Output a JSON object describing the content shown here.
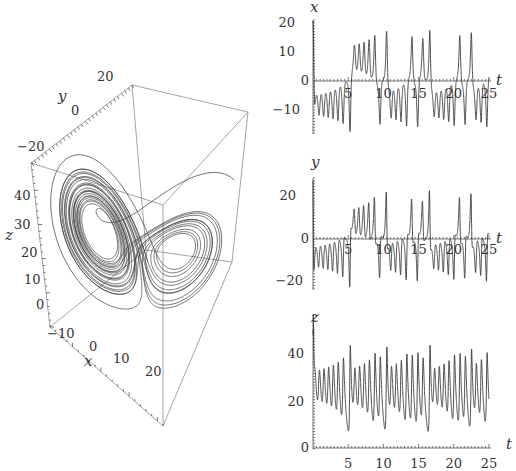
{
  "chart_data": [
    {
      "type": "line",
      "subtype": "3d-parametric",
      "title": "Lorenz attractor trajectory",
      "axes": {
        "x": {
          "label": "x",
          "ticks": [
            "−10",
            "0",
            "10",
            "20"
          ],
          "range": [
            -18,
            22
          ]
        },
        "y": {
          "label": "y",
          "ticks": [
            "−20",
            "0",
            "20"
          ],
          "range": [
            -28,
            28
          ]
        },
        "z": {
          "label": "z",
          "ticks": [
            "0",
            "10",
            "20",
            "30",
            "40"
          ],
          "range": [
            0,
            48
          ]
        }
      },
      "grid": false,
      "box": true,
      "system": {
        "sigma": 10,
        "rho": 28,
        "beta": 2.667,
        "t_range": [
          0,
          25
        ]
      }
    },
    {
      "type": "line",
      "title": "",
      "xlabel": "t",
      "ylabel": "x",
      "xticks": [
        "5",
        "10",
        "15",
        "20",
        "25"
      ],
      "yticks": [
        "20",
        "10",
        "0",
        "−10"
      ],
      "xlim": [
        0,
        25
      ],
      "ylim": [
        -18,
        20
      ],
      "features": {
        "initial_value": 20,
        "early_oscillation_center": -8,
        "max_peak": 18,
        "min_trough": -17,
        "first_crossing_t": 14.3
      }
    },
    {
      "type": "line",
      "title": "",
      "xlabel": "t",
      "ylabel": "y",
      "xticks": [
        "5",
        "10",
        "15",
        "20",
        "25"
      ],
      "yticks": [
        "20",
        "0",
        "−20"
      ],
      "xlim": [
        0,
        25
      ],
      "ylim": [
        -23,
        28
      ],
      "features": {
        "initial_value": 28,
        "early_oscillation_center": -8,
        "max_peak": 24,
        "min_trough": -22,
        "first_crossing_t": 14.3
      }
    },
    {
      "type": "line",
      "title": "",
      "xlabel": "t",
      "ylabel": "z",
      "xticks": [
        "5",
        "10",
        "15",
        "20",
        "25"
      ],
      "yticks": [
        "40",
        "20",
        "0"
      ],
      "xlim": [
        0,
        25
      ],
      "ylim": [
        0,
        48
      ],
      "features": {
        "initial_value": 48,
        "early_oscillation_center": 27,
        "max_peak": 44,
        "min_trough": 8
      }
    }
  ],
  "labels": {
    "p3d": {
      "x": "x",
      "y": "y",
      "z": "z",
      "xt": [
        "−10",
        "0",
        "10",
        "20"
      ],
      "yt": [
        "−20",
        "0",
        "20"
      ],
      "zt": [
        "0",
        "10",
        "20",
        "30",
        "40"
      ]
    },
    "px": {
      "yl": "x",
      "tl": "t",
      "yt": [
        "20",
        "10",
        "0",
        "−10"
      ],
      "xt": [
        "5",
        "10",
        "15",
        "20",
        "25"
      ]
    },
    "py": {
      "yl": "y",
      "tl": "t",
      "yt": [
        "20",
        "0",
        "−20"
      ],
      "xt": [
        "5",
        "10",
        "15",
        "20",
        "25"
      ]
    },
    "pz": {
      "yl": "z",
      "tl": "t",
      "yt": [
        "40",
        "20",
        "0"
      ],
      "xt": [
        "5",
        "10",
        "15",
        "20",
        "25"
      ]
    }
  },
  "colors": {
    "curve": "#3a3a3a",
    "axis": "#555555",
    "box": "#9a9a9a",
    "text": "#333333"
  }
}
